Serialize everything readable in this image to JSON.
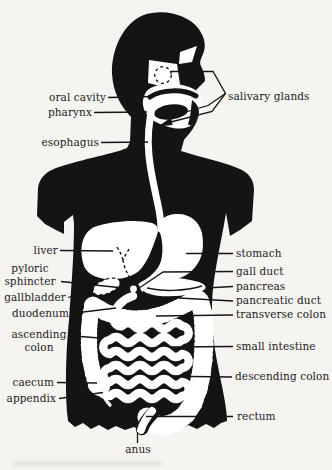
{
  "figure": {
    "kind": "anatomical-line-diagram"
  },
  "colors": {
    "ink": "#141414",
    "background": "#f5f4f1",
    "organ_fill": "#ffffff",
    "label_text": "#1b1b1b"
  },
  "labels": {
    "oral_cavity": "oral cavity",
    "pharynx": "pharynx",
    "salivary_glands": "salivary glands",
    "esophagus": "esophagus",
    "liver": "liver",
    "pyloric_sphincter": "pyloric sphincter",
    "gallbladder": "gallbladder",
    "duodenum": "duodenum",
    "ascending_colon": "ascending colon",
    "caecum": "caecum",
    "appendix": "appendix",
    "stomach": "stomach",
    "gall_duct": "gall duct",
    "pancreas": "pancreas",
    "pancreatic_duct": "pancreatic duct",
    "transverse_colon": "transverse colon",
    "small_intestine": "small intestine",
    "descending_colon": "descending colon",
    "rectum": "rectum",
    "anus": "anus"
  }
}
